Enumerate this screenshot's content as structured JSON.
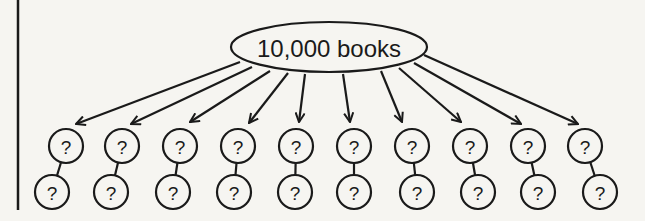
{
  "diagram": {
    "type": "tree",
    "root": {
      "label": "10,000 books",
      "cx": 329,
      "cy": 47,
      "rx": 98,
      "ry": 25
    },
    "node_label": "?",
    "node_radius": 17,
    "arrows": [
      {
        "from": [
          240,
          62
        ],
        "to": [
          76,
          124
        ]
      },
      {
        "from": [
          252,
          67
        ],
        "to": [
          131,
          124
        ]
      },
      {
        "from": [
          270,
          71
        ],
        "to": [
          190,
          122
        ]
      },
      {
        "from": [
          288,
          73
        ],
        "to": [
          249,
          123
        ]
      },
      {
        "from": [
          305,
          74
        ],
        "to": [
          299,
          122
        ]
      },
      {
        "from": [
          343,
          74
        ],
        "to": [
          350,
          122
        ]
      },
      {
        "from": [
          381,
          71
        ],
        "to": [
          402,
          122
        ]
      },
      {
        "from": [
          399,
          68
        ],
        "to": [
          461,
          122
        ]
      },
      {
        "from": [
          414,
          63
        ],
        "to": [
          521,
          124
        ]
      },
      {
        "from": [
          424,
          55
        ],
        "to": [
          578,
          124
        ]
      }
    ],
    "children": [
      {
        "top": [
          66,
          146
        ],
        "bottom": [
          52,
          192
        ]
      },
      {
        "top": [
          122,
          146
        ],
        "bottom": [
          111,
          192
        ]
      },
      {
        "top": [
          180,
          146
        ],
        "bottom": [
          173,
          192
        ]
      },
      {
        "top": [
          238,
          146
        ],
        "bottom": [
          234,
          192
        ]
      },
      {
        "top": [
          296,
          146
        ],
        "bottom": [
          295,
          192
        ]
      },
      {
        "top": [
          354,
          146
        ],
        "bottom": [
          354,
          192
        ]
      },
      {
        "top": [
          412,
          146
        ],
        "bottom": [
          417,
          192
        ]
      },
      {
        "top": [
          470,
          146
        ],
        "bottom": [
          478,
          192
        ]
      },
      {
        "top": [
          528,
          146
        ],
        "bottom": [
          538,
          192
        ]
      },
      {
        "top": [
          585,
          146
        ],
        "bottom": [
          600,
          192
        ]
      }
    ],
    "margin_line": {
      "x": 18,
      "y1": 0,
      "y2": 210
    },
    "stroke_color": "#1a1a1a",
    "background": "#f6f5f1"
  }
}
